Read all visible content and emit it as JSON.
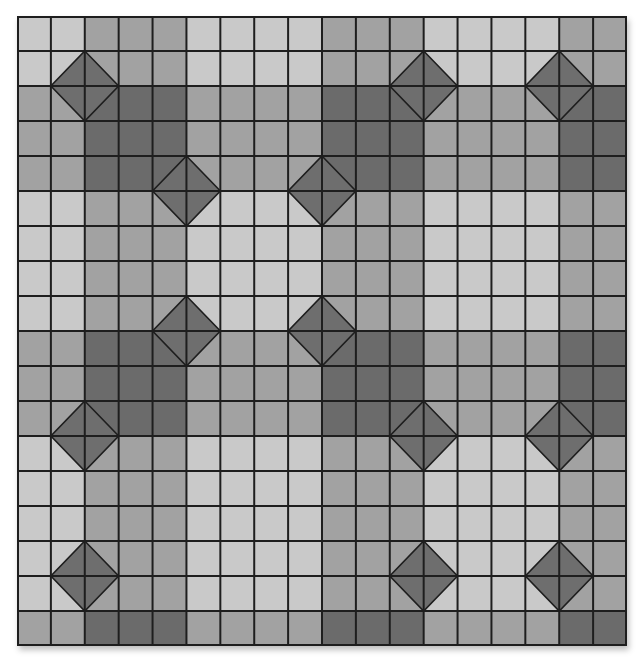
{
  "quilt": {
    "title": "Quilt block pattern",
    "columns": 18,
    "rows": 18,
    "colors": {
      "light": "#c9c9c9",
      "medium": "#a2a2a2",
      "dark": "#6b6b6b",
      "diamond": "#6e6e6e",
      "grid_line": "#1e1e1e"
    },
    "column_types": [
      "L",
      "L",
      "M",
      "M",
      "M",
      "L",
      "L",
      "L",
      "L",
      "M",
      "M",
      "M",
      "L",
      "L",
      "L",
      "L",
      "M",
      "M"
    ],
    "row_types": [
      "L",
      "L",
      "D",
      "D",
      "D",
      "L",
      "L",
      "L",
      "L",
      "D",
      "D",
      "D",
      "L",
      "L",
      "L",
      "L",
      "L",
      "D"
    ],
    "diamonds": [
      {
        "col": 2,
        "row": 2
      },
      {
        "col": 12,
        "row": 2
      },
      {
        "col": 16,
        "row": 2
      },
      {
        "col": 5,
        "row": 5
      },
      {
        "col": 9,
        "row": 5
      },
      {
        "col": 5,
        "row": 9
      },
      {
        "col": 9,
        "row": 9
      },
      {
        "col": 2,
        "row": 12
      },
      {
        "col": 12,
        "row": 12
      },
      {
        "col": 16,
        "row": 12
      },
      {
        "col": 2,
        "row": 16
      },
      {
        "col": 12,
        "row": 16
      },
      {
        "col": 16,
        "row": 16
      }
    ]
  }
}
